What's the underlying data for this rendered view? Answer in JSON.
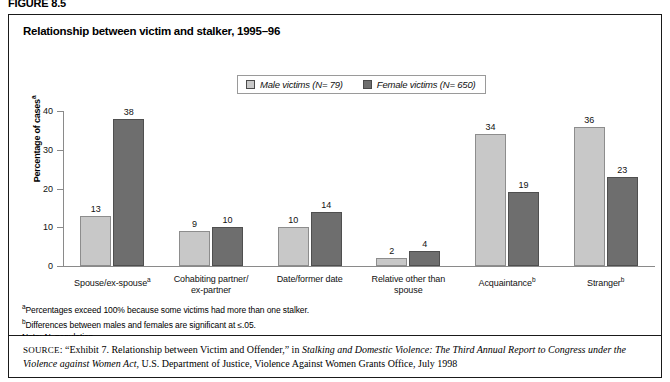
{
  "figure": {
    "label": "FIGURE 8.5",
    "title": "Relationship between victim and stalker, 1995–96"
  },
  "legend": {
    "male_label": "Male victims (N= 79)",
    "female_label": "Female victims (N= 650)"
  },
  "footnotes": {
    "a": "Percentages exceed 100% because some victims had more than one stalker.",
    "b": "Differences between males and females are significant at ≤.05.",
    "note_prefix": "Note: ",
    "note_italic": "N",
    "note_rest": "=population."
  },
  "source": {
    "kicker": "SOURCE",
    "part1": ": “Exhibit 7. Relationship between Victim and Offender,” in ",
    "italic1": "Stalking and Domestic Violence: The Third Annual Report to Congress under the Violence against Women Act",
    "part2": ", U.S. Department of Justice, Violence Against Women Grants Office, July 1998"
  },
  "colors": {
    "male_bar": "#c8c8c8",
    "female_bar": "#6e6e6e",
    "axis": "#8a8a8a",
    "border": "#1a1a1a"
  },
  "chart_data": {
    "type": "bar",
    "title": "Relationship between victim and stalker, 1995–96",
    "xlabel": "",
    "ylabel": "Percentage of cases",
    "ylabel_superscript": "a",
    "ylim": [
      0,
      40
    ],
    "yticks": [
      0,
      10,
      20,
      30,
      40
    ],
    "grid": false,
    "legend_position": "top-center",
    "categories": [
      "Spouse/ex-spouse",
      "Cohabiting partner/ex-partner",
      "Date/former date",
      "Relative other than spouse",
      "Acquaintance",
      "Stranger"
    ],
    "category_lines": [
      [
        "Spouse/ex-spouse"
      ],
      [
        "Cohabiting partner/",
        "ex-partner"
      ],
      [
        "Date/former date"
      ],
      [
        "Relative other than",
        "spouse"
      ],
      [
        "Acquaintance"
      ],
      [
        "Stranger"
      ]
    ],
    "category_superscripts": [
      "a",
      "",
      "",
      "",
      "b",
      "b"
    ],
    "series": [
      {
        "name": "Male victims (N= 79)",
        "color": "#c8c8c8",
        "values": [
          13,
          9,
          10,
          2,
          34,
          36
        ]
      },
      {
        "name": "Female victims (N= 650)",
        "color": "#6e6e6e",
        "values": [
          38,
          10,
          14,
          4,
          19,
          23
        ]
      }
    ]
  }
}
